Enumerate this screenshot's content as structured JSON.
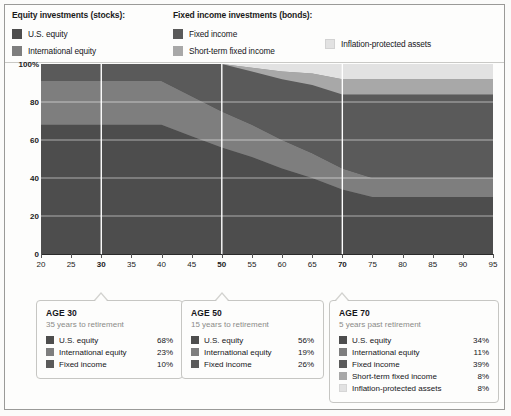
{
  "legend": {
    "groups": [
      {
        "title": "Equity investments (stocks):",
        "items": [
          {
            "label": "U.S. equity",
            "color": "#4d4d4d",
            "icon": "legend-swatch"
          },
          {
            "label": "International equity",
            "color": "#7e7e7e",
            "icon": "legend-swatch"
          }
        ]
      },
      {
        "title": "Fixed income investments (bonds):",
        "items": [
          {
            "label": "Fixed income",
            "color": "#5a5a5a",
            "icon": "legend-swatch"
          },
          {
            "label": "Short-term fixed income",
            "color": "#a8a8a8",
            "icon": "legend-swatch"
          },
          {
            "label": "Inflation-protected assets",
            "color": "#e2e2e2",
            "icon": "legend-swatch"
          }
        ]
      }
    ]
  },
  "chart_data": {
    "type": "area",
    "title": "",
    "subtitle": "",
    "xlabel": "",
    "ylabel": "",
    "stacked": true,
    "percent": true,
    "grid": true,
    "legend_position": "top",
    "xlim": [
      20,
      95
    ],
    "ylim": [
      0,
      100
    ],
    "xticks": [
      20,
      25,
      30,
      35,
      40,
      45,
      50,
      55,
      60,
      65,
      70,
      75,
      80,
      85,
      90,
      95
    ],
    "xtick_labels": [
      "20",
      "25",
      "30",
      "35",
      "40",
      "45",
      "50",
      "55",
      "60",
      "65",
      "70",
      "75",
      "80",
      "85",
      "90",
      "95"
    ],
    "xticks_bold": [
      30,
      50,
      70
    ],
    "yticks": [
      0,
      20,
      40,
      60,
      80,
      100
    ],
    "ytick_labels": [
      "0",
      "20",
      "40",
      "60",
      "80",
      "100%"
    ],
    "vertical_gridlines": [
      30,
      50,
      70
    ],
    "x": [
      20,
      25,
      30,
      35,
      40,
      45,
      50,
      55,
      60,
      65,
      70,
      75,
      80,
      85,
      90,
      95
    ],
    "series": [
      {
        "name": "U.S. equity",
        "color": "#4d4d4d",
        "values": [
          68,
          68,
          68,
          68,
          68,
          62,
          56,
          51,
          45,
          40,
          34,
          30,
          30,
          30,
          30,
          30
        ]
      },
      {
        "name": "International equity",
        "color": "#7e7e7e",
        "values": [
          23,
          23,
          23,
          23,
          23,
          21,
          19,
          17,
          15,
          13,
          11,
          10,
          10,
          10,
          10,
          10
        ]
      },
      {
        "name": "Fixed income",
        "color": "#5a5a5a",
        "values": [
          9,
          9,
          9,
          9,
          9,
          17,
          25,
          28,
          32,
          36,
          39,
          44,
          44,
          44,
          44,
          44
        ]
      },
      {
        "name": "Short-term fixed income",
        "color": "#a8a8a8",
        "values": [
          0,
          0,
          0,
          0,
          0,
          0,
          0,
          2,
          4,
          6,
          8,
          8,
          8,
          8,
          8,
          8
        ]
      },
      {
        "name": "Inflation-protected assets",
        "color": "#e2e2e2",
        "values": [
          0,
          0,
          0,
          0,
          0,
          0,
          0,
          2,
          4,
          5,
          8,
          8,
          8,
          8,
          8,
          8
        ]
      }
    ]
  },
  "callouts": [
    {
      "title": "AGE 30",
      "subtitle": "35 years to retirement",
      "age": 30,
      "rows": [
        {
          "label": "U.S. equity",
          "value": "68%",
          "color": "#4d4d4d"
        },
        {
          "label": "International equity",
          "value": "23%",
          "color": "#7e7e7e"
        },
        {
          "label": "Fixed income",
          "value": "10%",
          "color": "#5a5a5a"
        }
      ]
    },
    {
      "title": "AGE 50",
      "subtitle": "15 years to retirement",
      "age": 50,
      "rows": [
        {
          "label": "U.S. equity",
          "value": "56%",
          "color": "#4d4d4d"
        },
        {
          "label": "International equity",
          "value": "19%",
          "color": "#7e7e7e"
        },
        {
          "label": "Fixed income",
          "value": "26%",
          "color": "#5a5a5a"
        }
      ]
    },
    {
      "title": "AGE 70",
      "subtitle": "5 years past retirement",
      "age": 70,
      "rows": [
        {
          "label": "U.S. equity",
          "value": "34%",
          "color": "#4d4d4d"
        },
        {
          "label": "International equity",
          "value": "11%",
          "color": "#7e7e7e"
        },
        {
          "label": "Fixed income",
          "value": "39%",
          "color": "#5a5a5a"
        },
        {
          "label": "Short-term fixed income",
          "value": "8%",
          "color": "#a8a8a8"
        },
        {
          "label": "Inflation-protected assets",
          "value": "8%",
          "color": "#e2e2e2"
        }
      ]
    }
  ]
}
